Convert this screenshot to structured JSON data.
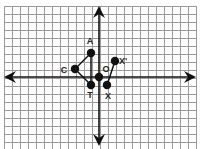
{
  "diagram": {
    "type": "coordinate-grid",
    "grid": {
      "cols": 24,
      "rows": 18,
      "spacing_px": 8,
      "left": 4,
      "top": 6,
      "line_color": "#9a9a9a"
    },
    "origin_px": [
      99,
      77
    ],
    "axes_color": "#111111",
    "points": [
      {
        "id": "A",
        "label": "A",
        "x": -1,
        "y": 3,
        "label_dx": -1,
        "label_dy": -9
      },
      {
        "id": "C",
        "label": "C",
        "x": -3,
        "y": 1,
        "label_dx": -11,
        "label_dy": 4
      },
      {
        "id": "T",
        "label": "T",
        "x": -1,
        "y": -1,
        "label_dx": -1,
        "label_dy": 13
      },
      {
        "id": "O",
        "label": "",
        "x": 0,
        "y": 0,
        "label_dx": 0,
        "label_dy": 0
      },
      {
        "id": "Xp",
        "label": "X'",
        "x": 2,
        "y": 2,
        "label_dx": 8,
        "label_dy": 3
      },
      {
        "id": "X",
        "label": "X",
        "x": 1,
        "y": -1,
        "label_dx": 1,
        "label_dy": 14
      }
    ],
    "extra_labels": [
      {
        "text": "O",
        "px": [
          106,
          72
        ]
      }
    ],
    "segments": [
      [
        "A",
        "C"
      ],
      [
        "C",
        "T"
      ],
      [
        "A",
        "T"
      ],
      [
        "X",
        "Xp"
      ]
    ]
  }
}
